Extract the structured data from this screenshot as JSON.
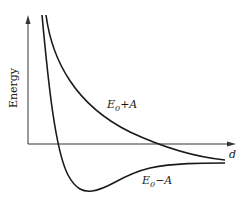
{
  "diagram": {
    "title": "",
    "y_axis_label": "Energy",
    "x_axis_label": "d",
    "curves": [
      {
        "name": "upper",
        "label": "E₀+A",
        "label_main": "E",
        "label_sub": "0",
        "label_rest": "+A"
      },
      {
        "name": "lower",
        "label": "E₀−A",
        "label_main": "E",
        "label_sub": "0",
        "label_rest": "−A"
      }
    ],
    "colors": {
      "line": "#1a1a1a",
      "axis": "#333333",
      "background": "#ffffff"
    }
  }
}
